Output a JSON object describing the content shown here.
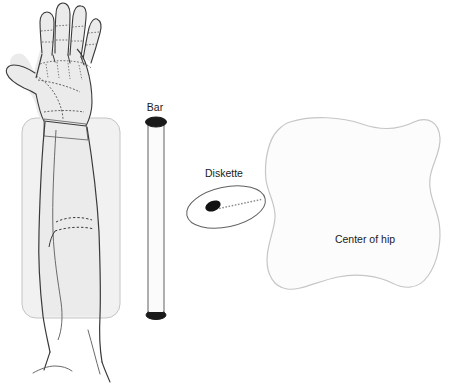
{
  "figure": {
    "background_color": "#ffffff",
    "ink_color": "#3a3a3a",
    "fill_gray": "#ededed",
    "outline_light": "#c9c9c9",
    "cap_dark": "#1a1a1a"
  },
  "labels": {
    "bar": "Bar",
    "diskette": "Diskette",
    "center_of_hip": "Center of hip"
  },
  "parts": {
    "hand_arm": {
      "name": "hand-and-forearm",
      "fill": "#ededed",
      "stroke": "#3a3a3a"
    },
    "field_rect": {
      "name": "forearm-field-rectangle",
      "fill": "#f0f0f0",
      "stroke": "#c4c4c4",
      "x": 22,
      "y": 118,
      "width": 98,
      "height": 200,
      "radius": 14
    },
    "bar": {
      "name": "calibration-bar",
      "x": 148,
      "top_y": 120,
      "bottom_y": 318,
      "width": 16,
      "cap_color": "#1a1a1a",
      "body_fill": "#fafafa",
      "body_stroke": "#555555"
    },
    "diskette": {
      "name": "diskette-ellipse",
      "center_x": 226,
      "center_y": 207,
      "rx": 40,
      "ry": 20,
      "rotation_deg": -12,
      "stroke": "#555555",
      "fill": "#ffffff",
      "marker_center_x": 213,
      "marker_center_y": 206,
      "marker_rx": 8,
      "marker_ry": 5,
      "marker_color": "#111111"
    },
    "hip": {
      "name": "hip-region-blob",
      "fill": "#fcfcfc",
      "stroke": "#c9c9c9",
      "label_x": 365,
      "label_y": 243
    }
  },
  "label_positions": {
    "bar": {
      "x": 155,
      "y": 111,
      "anchor": "middle"
    },
    "diskette": {
      "x": 224,
      "y": 177,
      "anchor": "middle"
    },
    "center_of_hip": {
      "x": 365,
      "y": 243,
      "anchor": "middle"
    }
  }
}
